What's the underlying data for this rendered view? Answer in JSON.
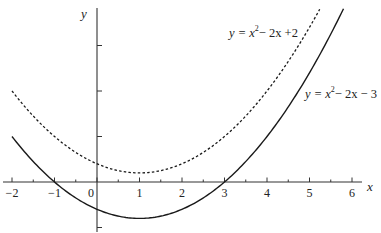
{
  "chart_data": {
    "type": "line",
    "title": "",
    "xlabel": "x",
    "ylabel": "y",
    "xlim": [
      -2.2,
      6.2
    ],
    "ylim": [
      -5.3,
      19.5
    ],
    "x_ticks": [
      -2,
      -1,
      0,
      1,
      2,
      3,
      4,
      5,
      6
    ],
    "x_tick_labels": [
      "−2",
      "−1",
      "0",
      "1",
      "2",
      "3",
      "4",
      "5",
      "6"
    ],
    "x_minor_step": 0.5,
    "y_ticks": [
      -5,
      5,
      10,
      15
    ],
    "grid": false,
    "series": [
      {
        "name": "y = x² − 2x + 2",
        "formula": {
          "a": 1,
          "b": -2,
          "c": 2
        },
        "style": "dashed",
        "x_range": [
          -2,
          5.24
        ],
        "label": {
          "prefix": "y = x",
          "sup": "2",
          "suffix": "− 2x +2"
        },
        "label_position": "top-center"
      },
      {
        "name": "y = x² − 2x − 3",
        "formula": {
          "a": 1,
          "b": -2,
          "c": -3
        },
        "style": "solid",
        "x_range": [
          -2,
          5.8
        ],
        "label": {
          "prefix": "y = x",
          "sup": "2",
          "suffix": "− 2x − 3"
        },
        "label_position": "right"
      }
    ],
    "key_points": [
      {
        "series": 1,
        "x": -1,
        "y": 0
      },
      {
        "series": 1,
        "x": 3,
        "y": 0
      },
      {
        "series": 1,
        "x": 1,
        "y": -4
      },
      {
        "series": 0,
        "x": 1,
        "y": 1
      }
    ]
  }
}
